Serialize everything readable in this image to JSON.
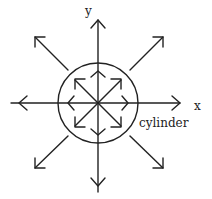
{
  "diagram": {
    "axes": {
      "x_label": "x",
      "y_label": "y"
    },
    "circle_label": "cylinder",
    "stroke_color": "#222222",
    "background": "#ffffff"
  }
}
